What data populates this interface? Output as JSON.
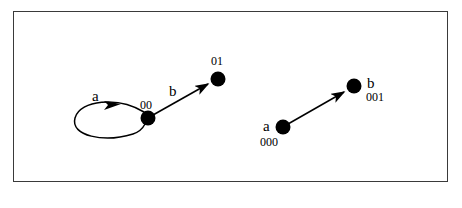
{
  "figure": {
    "border_color": "#3a3a3a",
    "ink_color": "#000000",
    "background_color": "#ffffff"
  },
  "diagrams": [
    {
      "name": "left-automaton",
      "nodes": [
        {
          "id": "node-00",
          "state_label": "00",
          "cx": 148,
          "cy": 118,
          "r": 7.5,
          "state_label_x": 140,
          "state_label_y": 101
        },
        {
          "id": "node-01",
          "state_label": "01",
          "cx": 218,
          "cy": 79,
          "r": 7.5,
          "state_label_x": 211,
          "state_label_y": 56
        }
      ],
      "edges": [
        {
          "id": "edge-a-self-loop",
          "symbol": "a",
          "from": "node-00",
          "to": "node-00",
          "kind": "self-loop",
          "symbol_x": 92,
          "symbol_y": 90
        },
        {
          "id": "edge-b-00-to-01",
          "symbol": "b",
          "from": "node-00",
          "to": "node-01",
          "kind": "arrow",
          "symbol_x": 169,
          "symbol_y": 85
        }
      ]
    },
    {
      "name": "right-automaton",
      "nodes": [
        {
          "id": "node-000",
          "state_label": "000",
          "symbol": "a",
          "cx": 283,
          "cy": 127,
          "r": 7.5,
          "symbol_x": 263,
          "symbol_y": 121,
          "state_label_x": 262,
          "state_label_y": 137
        },
        {
          "id": "node-001",
          "state_label": "001",
          "symbol": "b",
          "cx": 354,
          "cy": 86,
          "r": 7.5,
          "symbol_x": 367,
          "symbol_y": 77,
          "state_label_x": 366,
          "state_label_y": 91
        }
      ],
      "edges": [
        {
          "id": "edge-000-to-001",
          "symbol": "",
          "from": "node-000",
          "to": "node-001",
          "kind": "arrow",
          "symbol_x": 0,
          "symbol_y": 0
        }
      ]
    }
  ],
  "labels": {
    "left_a": "a",
    "left_00": "00",
    "left_b": "b",
    "left_01": "01",
    "right_a": "a",
    "right_000": "000",
    "right_b": "b",
    "right_001": "001"
  }
}
